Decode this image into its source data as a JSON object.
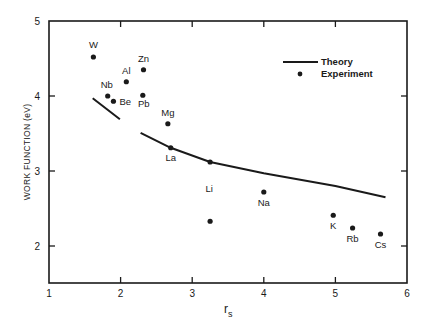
{
  "chart_data": {
    "type": "scatter",
    "title": "",
    "xlabel": "r",
    "xlabel_subscript": "s",
    "ylabel": "WORK FUNCTION (eV)",
    "xlim": [
      1,
      6
    ],
    "ylim": [
      1.5,
      5
    ],
    "xticks": [
      1,
      2,
      3,
      4,
      5,
      6
    ],
    "yticks": [
      2,
      3,
      4,
      5
    ],
    "grid": false,
    "legend_position": "upper right",
    "legend": [
      {
        "name": "Theory",
        "marker": "line"
      },
      {
        "name": "Experiment",
        "marker": "dot"
      }
    ],
    "series": [
      {
        "name": "Experiment",
        "kind": "scatter",
        "points": [
          {
            "label": "W",
            "x": 1.62,
            "y": 4.52
          },
          {
            "label": "Nb",
            "x": 1.82,
            "y": 4.0
          },
          {
            "label": "Be",
            "x": 1.9,
            "y": 3.93
          },
          {
            "label": "Al",
            "x": 2.08,
            "y": 4.19
          },
          {
            "label": "Zn",
            "x": 2.32,
            "y": 4.35
          },
          {
            "label": "Pb",
            "x": 2.31,
            "y": 4.01
          },
          {
            "label": "Mg",
            "x": 2.66,
            "y": 3.63
          },
          {
            "label": "La",
            "x": 2.7,
            "y": 3.31
          },
          {
            "label": "Li",
            "x": 3.25,
            "y": 3.12
          },
          {
            "label": "",
            "x": 3.25,
            "y": 2.33
          },
          {
            "label": "Na",
            "x": 4.0,
            "y": 2.72
          },
          {
            "label": "K",
            "x": 4.97,
            "y": 2.41
          },
          {
            "label": "Rb",
            "x": 5.24,
            "y": 2.24
          },
          {
            "label": "Cs",
            "x": 5.63,
            "y": 2.16
          }
        ]
      },
      {
        "name": "Theory",
        "kind": "line",
        "segments": [
          [
            [
              1.61,
              3.97
            ],
            [
              1.8,
              3.83
            ],
            [
              1.99,
              3.69
            ]
          ],
          [
            [
              2.28,
              3.51
            ],
            [
              2.7,
              3.31
            ],
            [
              3.25,
              3.12
            ],
            [
              4.0,
              2.97
            ],
            [
              5.0,
              2.8
            ],
            [
              5.7,
              2.65
            ]
          ]
        ]
      }
    ]
  },
  "labels": {
    "x_axis_title": "r",
    "x_axis_sub": "s",
    "y_axis_title": "WORK FUNCTION (eV)",
    "legend_theory": "Theory",
    "legend_experiment": "Experiment"
  }
}
